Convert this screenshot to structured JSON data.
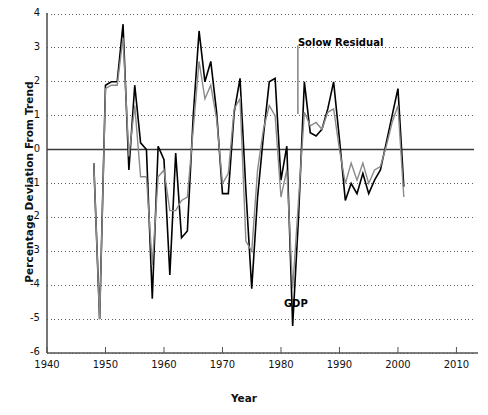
{
  "chart_data": {
    "type": "line",
    "title": "",
    "xlabel": "Year",
    "ylabel": "Percentage Deviation From Trend",
    "xlim": [
      1940,
      2013
    ],
    "ylim": [
      -6,
      4
    ],
    "xticks": [
      1940,
      1950,
      1960,
      1970,
      1980,
      1990,
      2000,
      2010
    ],
    "xtick_labels": [
      "1940",
      "1950",
      "1960",
      "1970",
      "1980",
      "1990",
      "2000",
      "2010"
    ],
    "yticks": [
      4,
      3,
      2,
      1,
      0,
      -1,
      -2,
      -3,
      -4,
      -5,
      -6
    ],
    "ytick_labels": [
      "4",
      "3",
      "2",
      "1",
      "0",
      "-1",
      "-2",
      "-3",
      "-4",
      "-5",
      "-6"
    ],
    "grid": "horizontal-dotted",
    "zero_line": 0,
    "legend": "annotations",
    "annotations": [
      {
        "name": "solow-residual-annotation",
        "text": "Solow Residual",
        "x": 1987.0,
        "y": 2.95,
        "leader_to_y": 1.05
      },
      {
        "name": "gdp-annotation",
        "text": "GDP",
        "x": 1984.6,
        "y": -4.75
      }
    ],
    "series": [
      {
        "name": "GDP",
        "color": "#000000",
        "width": 1.6,
        "x": [
          1948,
          1949,
          1950,
          1951,
          1952,
          1953,
          1954,
          1955,
          1956,
          1957,
          1958,
          1959,
          1960,
          1961,
          1962,
          1963,
          1964,
          1965,
          1966,
          1967,
          1968,
          1969,
          1970,
          1971,
          1972,
          1973,
          1974,
          1975,
          1976,
          1977,
          1978,
          1979,
          1980,
          1981,
          1982,
          1983,
          1984,
          1985,
          1986,
          1987,
          1988,
          1989,
          1990,
          1991,
          1992,
          1993,
          1994,
          1995,
          1996,
          1997,
          1998,
          1999,
          2000,
          2001
        ],
        "values": [
          -0.4,
          -5.0,
          1.9,
          2.0,
          2.0,
          3.7,
          -0.6,
          1.9,
          0.2,
          0.0,
          -4.4,
          0.1,
          -0.3,
          -3.7,
          -0.1,
          -2.6,
          -2.4,
          1.0,
          3.5,
          2.0,
          2.6,
          1.1,
          -1.3,
          -1.3,
          1.1,
          2.1,
          -1.2,
          -4.1,
          -1.4,
          0.4,
          2.0,
          2.1,
          -0.9,
          0.1,
          -5.2,
          -2.0,
          2.0,
          0.5,
          0.4,
          0.6,
          1.2,
          2.0,
          0.3,
          -1.5,
          -1.0,
          -1.3,
          -0.7,
          -1.3,
          -0.9,
          -0.6,
          0.2,
          1.0,
          1.8,
          -1.1
        ]
      },
      {
        "name": "Solow Residual",
        "color": "#8a8a8a",
        "width": 1.4,
        "x": [
          1948,
          1949,
          1950,
          1951,
          1952,
          1953,
          1954,
          1955,
          1956,
          1957,
          1958,
          1959,
          1960,
          1961,
          1962,
          1963,
          1964,
          1965,
          1966,
          1967,
          1968,
          1969,
          1970,
          1971,
          1972,
          1973,
          1974,
          1975,
          1976,
          1977,
          1978,
          1979,
          1980,
          1981,
          1982,
          1983,
          1984,
          1985,
          1986,
          1987,
          1988,
          1989,
          1990,
          1991,
          1992,
          1993,
          1994,
          1995,
          1996,
          1997,
          1998,
          1999,
          2000,
          2001
        ],
        "values": [
          -0.4,
          -5.0,
          1.8,
          1.9,
          1.9,
          3.3,
          -0.2,
          1.3,
          -0.8,
          -0.8,
          -3.4,
          -0.8,
          -0.6,
          -1.8,
          -1.8,
          -1.5,
          -1.4,
          0.6,
          2.6,
          1.5,
          1.9,
          0.9,
          -1.0,
          -0.7,
          1.2,
          1.5,
          -2.7,
          -3.0,
          -0.6,
          0.6,
          1.3,
          1.0,
          -1.4,
          -0.6,
          -4.1,
          -1.5,
          1.1,
          0.7,
          0.8,
          0.6,
          1.1,
          1.2,
          0.0,
          -1.0,
          -0.4,
          -0.9,
          -0.4,
          -1.0,
          -0.6,
          -0.5,
          0.1,
          0.8,
          1.3,
          -1.4
        ]
      }
    ]
  },
  "axis": {
    "left_spine_color": "#555555",
    "bottom_spine_color": "#555555",
    "grid_color": "#4d4d4d"
  }
}
